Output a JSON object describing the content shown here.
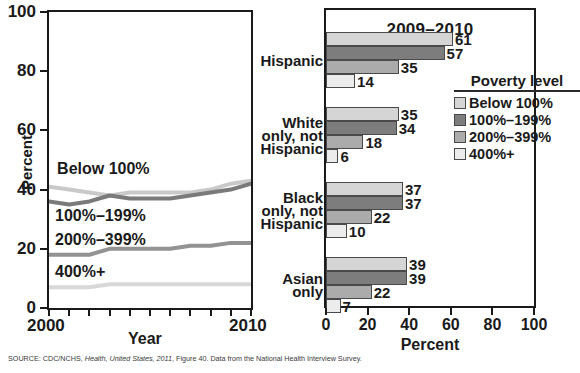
{
  "source_note": {
    "prefix": "SOURCE: CDC/NCHS, ",
    "italic": "Health, United States, 2011",
    "suffix": ", Figure 40. Data from the National Health Interview Survey."
  },
  "legend": {
    "title": "Poverty level",
    "items": [
      {
        "label": "Below 100%",
        "color": "#d5d5d5"
      },
      {
        "label": "100%–199%",
        "color": "#7d7d7d"
      },
      {
        "label": "200%–399%",
        "color": "#ababab"
      },
      {
        "label": "400%+",
        "color": "#ececec"
      }
    ]
  },
  "chart_data": [
    {
      "type": "line",
      "id": "trend",
      "title": "",
      "xlabel": "Year",
      "ylabel": "Percent",
      "xlim": [
        2000,
        2010
      ],
      "ylim": [
        0,
        100
      ],
      "yticks": [
        0,
        20,
        40,
        60,
        80,
        100
      ],
      "xticks": [
        2000,
        2001,
        2002,
        2003,
        2004,
        2005,
        2006,
        2007,
        2008,
        2009,
        2010
      ],
      "xtick_labels_shown": [
        "2000",
        "2010"
      ],
      "grid": false,
      "x": [
        2000,
        2001,
        2002,
        2003,
        2004,
        2005,
        2006,
        2007,
        2008,
        2009,
        2010
      ],
      "series": [
        {
          "name": "Below 100%",
          "color": "#c9c9c9",
          "label_x": 2000.4,
          "label_y": 47,
          "values": [
            41,
            40,
            39,
            38,
            39,
            39,
            39,
            39,
            40,
            42,
            43
          ]
        },
        {
          "name": "100%–199%",
          "color": "#7a7a7a",
          "label_x": 2000.3,
          "label_y": 31,
          "values": [
            36,
            35,
            36,
            38,
            37,
            37,
            37,
            38,
            39,
            40,
            42
          ]
        },
        {
          "name": "200%–399%",
          "color": "#939393",
          "label_x": 2000.3,
          "label_y": 23,
          "values": [
            18,
            18,
            18,
            20,
            20,
            20,
            20,
            21,
            21,
            22,
            22
          ]
        },
        {
          "name": "400%+",
          "color": "#d8d8d8",
          "label_x": 2000.3,
          "label_y": 12,
          "values": [
            7,
            7,
            7,
            8,
            8,
            8,
            8,
            8,
            8,
            8,
            8
          ]
        }
      ]
    },
    {
      "type": "bar",
      "id": "by-race",
      "orientation": "horizontal",
      "title": "2009–2010",
      "xlabel": "Percent",
      "ylabel": "",
      "xlim": [
        0,
        100
      ],
      "xticks": [
        0,
        20,
        40,
        60,
        80,
        100
      ],
      "grid": false,
      "categories": [
        "Hispanic",
        "White only, not Hispanic",
        "Black only, not Hispanic",
        "Asian only"
      ],
      "category_lines": [
        [
          "Hispanic"
        ],
        [
          "White",
          "only, not",
          "Hispanic"
        ],
        [
          "Black",
          "only, not",
          "Hispanic"
        ],
        [
          "Asian",
          "only"
        ]
      ],
      "series": [
        {
          "name": "Below 100%",
          "color": "#d5d5d5",
          "values": [
            61,
            35,
            37,
            39
          ]
        },
        {
          "name": "100%–199%",
          "color": "#7d7d7d",
          "values": [
            57,
            34,
            37,
            39
          ]
        },
        {
          "name": "200%–399%",
          "color": "#ababab",
          "values": [
            35,
            18,
            22,
            22
          ]
        },
        {
          "name": "400%+",
          "color": "#ececec",
          "values": [
            14,
            6,
            10,
            7
          ]
        }
      ]
    }
  ]
}
